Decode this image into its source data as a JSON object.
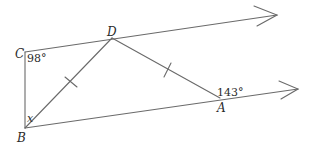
{
  "diagram": {
    "type": "geometry",
    "colors": {
      "stroke": "#6a6a6a",
      "text": "#2a2a2a",
      "background": "#ffffff"
    },
    "points": {
      "C": {
        "label": "C",
        "x": 25,
        "y": 52
      },
      "B": {
        "label": "B",
        "x": 25,
        "y": 128
      },
      "D": {
        "label": "D",
        "x": 112,
        "y": 38
      },
      "A": {
        "label": "A",
        "x": 220,
        "y": 98
      }
    },
    "segments": [
      {
        "name": "CB",
        "from": "C",
        "to": "B"
      },
      {
        "name": "CD",
        "from": "C",
        "to": "D"
      },
      {
        "name": "BD",
        "from": "B",
        "to": "D",
        "tick": true
      },
      {
        "name": "DA",
        "from": "D",
        "to": "A",
        "tick": true
      },
      {
        "name": "BA",
        "from": "B",
        "to": "A"
      }
    ],
    "rays": [
      {
        "name": "ray-top",
        "from": "C",
        "through": "D",
        "arrow_tip": {
          "x": 277,
          "y": 15
        }
      },
      {
        "name": "ray-bottom",
        "from": "B",
        "through": "A",
        "arrow_tip": {
          "x": 298,
          "y": 89
        }
      }
    ],
    "angles": {
      "C": {
        "text": "98°"
      },
      "A": {
        "text": "143°"
      },
      "B": {
        "text": "x"
      }
    },
    "labels": {
      "C": "C",
      "B": "B",
      "D": "D",
      "A": "A"
    },
    "annotations": [
      "BD = DA (tick marks)",
      "CD ∥ BA (parallel rays with arrows)"
    ]
  }
}
